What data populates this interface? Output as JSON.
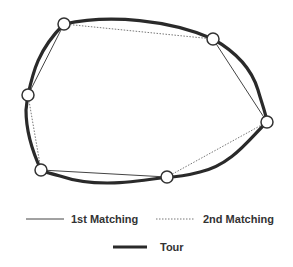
{
  "diagram": {
    "nodes": [
      {
        "id": "n1",
        "x": 64,
        "y": 24
      },
      {
        "id": "n2",
        "x": 213,
        "y": 39
      },
      {
        "id": "n3",
        "x": 267,
        "y": 122
      },
      {
        "id": "n4",
        "x": 28,
        "y": 95
      },
      {
        "id": "n5",
        "x": 41,
        "y": 170
      },
      {
        "id": "n6",
        "x": 167,
        "y": 177
      }
    ],
    "first_matching_edges": [
      [
        "n1",
        "n4"
      ],
      [
        "n2",
        "n3"
      ],
      [
        "n5",
        "n6"
      ]
    ],
    "second_matching_edges": [
      [
        "n1",
        "n2"
      ],
      [
        "n4",
        "n5"
      ],
      [
        "n6",
        "n3"
      ]
    ],
    "tour_order": [
      "n1",
      "n2",
      "n3",
      "n6",
      "n5",
      "n4"
    ],
    "colors": {
      "tour": "#2a2a2a",
      "first_matching": "#444444",
      "second_matching": "#777777",
      "node_fill": "#ffffff",
      "node_stroke": "#333333"
    }
  },
  "legend": {
    "first_matching": "1st Matching",
    "second_matching": "2nd Matching",
    "tour": "Tour"
  }
}
